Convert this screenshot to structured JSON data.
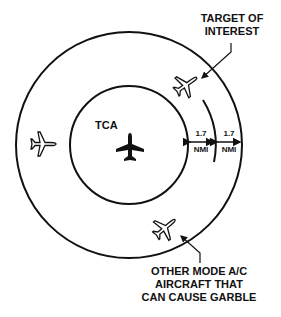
{
  "diagram": {
    "center_label": "TCA",
    "target_label_line1": "TARGET OF",
    "target_label_line2": "INTEREST",
    "other_label_line1": "OTHER MODE A/C",
    "other_label_line2": "AIRCRAFT THAT",
    "other_label_line3": "CAN CAUSE GARBLE",
    "distance_inner": {
      "value": "1.7",
      "unit": "NMI"
    },
    "distance_outer": {
      "value": "1.7",
      "unit": "NMI"
    },
    "icons": [
      "tca-aircraft-icon",
      "target-aircraft-icon",
      "left-aircraft-icon",
      "garble-aircraft-icon"
    ],
    "colors": {
      "stroke": "#111111",
      "background": "#ffffff"
    }
  }
}
